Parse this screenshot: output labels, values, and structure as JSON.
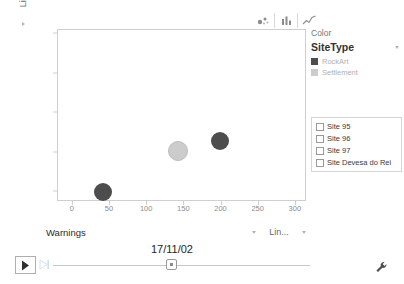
{
  "toolbar": {
    "icons": [
      {
        "name": "scatter-chart-icon",
        "label": "Bubble chart"
      },
      {
        "name": "bar-chart-icon",
        "label": "Bar chart"
      },
      {
        "name": "line-chart-icon",
        "label": "Line chart"
      }
    ]
  },
  "axes": {
    "y": {
      "title": "PreservationState",
      "ticks": [
        "2",
        "2.5",
        "3",
        "3.5",
        "4"
      ],
      "scale_label": "Lin."
    },
    "x": {
      "title": "Warnings",
      "ticks": [
        "0",
        "50",
        "100",
        "150",
        "200",
        "250",
        "300"
      ],
      "scale_label": "Lin..."
    }
  },
  "legend": {
    "title": "Color",
    "field": "SiteType",
    "entries": [
      {
        "label": "RockArt",
        "color": "#4d4d4d"
      },
      {
        "label": "Settlement",
        "color": "#cccccc"
      }
    ]
  },
  "site_list": {
    "items": [
      {
        "label": "Site 95",
        "checked": false
      },
      {
        "label": "Site 96",
        "checked": false
      },
      {
        "label": "Site 97",
        "checked": false
      },
      {
        "label": "Site Devesa do Rei",
        "checked": false
      }
    ]
  },
  "timeline": {
    "date": "17/11/02",
    "play_label": "Play",
    "step_label": "Step forward",
    "settings_label": "Settings"
  },
  "chart_data": {
    "type": "scatter",
    "title": "",
    "xlabel": "Warnings",
    "ylabel": "PreservationState",
    "xlim": [
      -20,
      315
    ],
    "ylim": [
      1.88,
      4.05
    ],
    "grid": false,
    "legend_position": "right",
    "xticks": [
      0,
      50,
      100,
      150,
      200,
      250,
      300
    ],
    "yticks": [
      2,
      2.5,
      3,
      3.5,
      4
    ],
    "series": [
      {
        "name": "RockArt",
        "color": "#4d4d4d",
        "points": [
          {
            "x": 40,
            "y": 2.0,
            "size": 18
          },
          {
            "x": 198,
            "y": 2.65,
            "size": 18
          }
        ]
      },
      {
        "name": "Settlement",
        "color": "#cccccc",
        "points": [
          {
            "x": 142,
            "y": 2.52,
            "size": 18
          }
        ]
      }
    ]
  }
}
